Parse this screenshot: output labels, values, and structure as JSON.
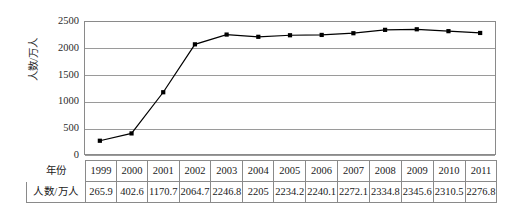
{
  "chart_data": {
    "type": "line",
    "title": "",
    "xlabel": "年份",
    "ylabel": "人数/万人",
    "categories": [
      "1999",
      "2000",
      "2001",
      "2002",
      "2003",
      "2004",
      "2005",
      "2006",
      "2007",
      "2008",
      "2009",
      "2010",
      "2011"
    ],
    "values": [
      265.9,
      402.6,
      1170.7,
      2064.7,
      2246.8,
      2205,
      2234.2,
      2240.1,
      2272.1,
      2334.8,
      2345.6,
      2310.5,
      2276.8
    ],
    "value_labels": [
      "265.9",
      "402.6",
      "1170.7",
      "2064.7",
      "2246.8",
      "2205",
      "2234.2",
      "2240.1",
      "2272.1",
      "2334.8",
      "2345.6",
      "2310.5",
      "2276.8"
    ],
    "ylim": [
      0,
      2500
    ],
    "yticks": [
      0,
      500,
      1000,
      1500,
      2000,
      2500
    ],
    "ytick_labels": [
      "0",
      "500",
      "1000",
      "1500",
      "2000",
      "2500"
    ],
    "grid": true,
    "legend": "none",
    "series_color": "#000000",
    "marker": "square",
    "gridline_color": "#9a9a9a",
    "axis_color": "#8a8a8a"
  },
  "table": {
    "row_headers": [
      "年份",
      "人数/万人"
    ],
    "rows": [
      [
        "1999",
        "2000",
        "2001",
        "2002",
        "2003",
        "2004",
        "2005",
        "2006",
        "2007",
        "2008",
        "2009",
        "2010",
        "2011"
      ],
      [
        "265.9",
        "402.6",
        "1170.7",
        "2064.7",
        "2246.8",
        "2205",
        "2234.2",
        "2240.1",
        "2272.1",
        "2334.8",
        "2345.6",
        "2310.5",
        "2276.8"
      ]
    ]
  }
}
